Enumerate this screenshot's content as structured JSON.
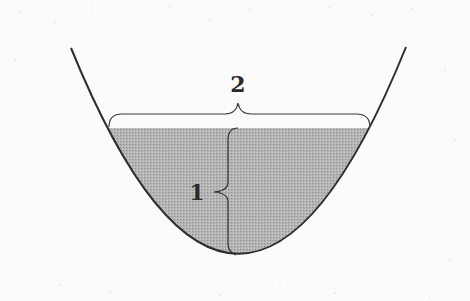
{
  "diagram": {
    "type": "parabolic-container-with-liquid",
    "labels": {
      "width_label": "2",
      "depth_label": "1"
    },
    "colors": {
      "background": "#fbfbfb",
      "outline": "#2e2e2e",
      "liquid_fill": "#a9a9a9"
    }
  }
}
